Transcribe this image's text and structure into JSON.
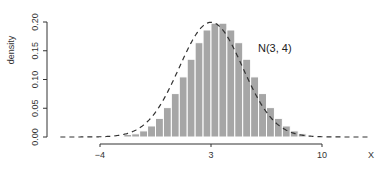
{
  "chart_data": {
    "type": "bar",
    "title": "",
    "xlabel": "X",
    "ylabel": "density",
    "annotation": "N(3, 4)",
    "xlim": [
      -7.5,
      12.5
    ],
    "ylim": [
      0,
      0.2
    ],
    "x_ticks": [
      -4,
      3,
      10
    ],
    "x_tick_labels": [
      "-4",
      "3",
      "10"
    ],
    "y_ticks": [
      0.0,
      0.05,
      0.1,
      0.15,
      0.2
    ],
    "y_tick_labels": [
      "0.00",
      "0.05",
      "0.10",
      "0.15",
      "0.20"
    ],
    "bin_width": 0.5,
    "bin_edges_start": -2.5,
    "bins": [
      {
        "x0": -2.5,
        "x1": -2.0,
        "density": 0.0043
      },
      {
        "x0": -2.0,
        "x1": -1.5,
        "density": 0.0055
      },
      {
        "x0": -1.5,
        "x1": -1.0,
        "density": 0.0106
      },
      {
        "x0": -1.0,
        "x1": -0.5,
        "density": 0.0192
      },
      {
        "x0": -0.5,
        "x1": 0.0,
        "density": 0.0324
      },
      {
        "x0": 0.0,
        "x1": 0.5,
        "density": 0.0511
      },
      {
        "x0": 0.5,
        "x1": 1.0,
        "density": 0.0755
      },
      {
        "x0": 1.0,
        "x1": 1.5,
        "density": 0.1045
      },
      {
        "x0": 1.5,
        "x1": 2.0,
        "density": 0.1352
      },
      {
        "x0": 2.0,
        "x1": 2.5,
        "density": 0.164
      },
      {
        "x0": 2.5,
        "x1": 3.0,
        "density": 0.1861
      },
      {
        "x0": 3.0,
        "x1": 3.5,
        "density": 0.1979
      },
      {
        "x0": 3.5,
        "x1": 4.0,
        "density": 0.1979
      },
      {
        "x0": 4.0,
        "x1": 4.5,
        "density": 0.1861
      },
      {
        "x0": 4.5,
        "x1": 5.0,
        "density": 0.164
      },
      {
        "x0": 5.0,
        "x1": 5.5,
        "density": 0.1352
      },
      {
        "x0": 5.5,
        "x1": 6.0,
        "density": 0.1045
      },
      {
        "x0": 6.0,
        "x1": 6.5,
        "density": 0.0755
      },
      {
        "x0": 6.5,
        "x1": 7.0,
        "density": 0.0511
      },
      {
        "x0": 7.0,
        "x1": 7.5,
        "density": 0.0324
      },
      {
        "x0": 7.5,
        "x1": 8.0,
        "density": 0.0192
      },
      {
        "x0": 8.0,
        "x1": 8.5,
        "density": 0.0106
      },
      {
        "x0": 8.5,
        "x1": 9.0,
        "density": 0.0055
      }
    ],
    "curve": {
      "type": "normal_density",
      "mean": 3,
      "variance": 4,
      "x_range": [
        -6.5,
        13
      ],
      "style": "dashed"
    },
    "colors": {
      "bar_fill": "#a6a6a6",
      "bar_edge": "#ffffff",
      "curve": "#333333",
      "axis": "#333333"
    },
    "grid": false,
    "legend": null
  }
}
